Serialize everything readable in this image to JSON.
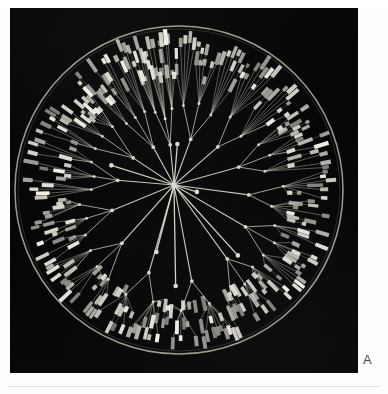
{
  "figure": {
    "panel_label": "A",
    "caption_present": false,
    "background_color": "#ffffff",
    "panel_color": "#050505",
    "stroke_color": "#e8e4d8",
    "leaf_color": "#f2efe6",
    "node_color": "#ddd9cc",
    "ring_color": "#b9b4a5"
  },
  "chart_data": {
    "type": "radial-dendrogram",
    "title": "",
    "subtitle": "",
    "xlabel": "",
    "ylabel": "",
    "legend": [],
    "annotations": [
      "A"
    ],
    "layout": {
      "center_x": 169,
      "center_y": 182,
      "outer_ring_radius": 164,
      "leaf_band_inner_radius": 96,
      "leaf_band_outer_radius": 158,
      "grid": false,
      "legend_position": "none"
    },
    "root": {
      "x": 164,
      "y": 177,
      "label": "root"
    },
    "hubs": [
      {
        "angle_deg": 268,
        "radius": 46,
        "label": "hub-upper"
      },
      {
        "angle_deg": 6,
        "radius": 18,
        "label": "hub-right"
      },
      {
        "angle_deg": 110,
        "radius": 66,
        "label": "hub-lower-left"
      },
      {
        "angle_deg": 92,
        "radius": 96,
        "label": "hub-lower"
      },
      {
        "angle_deg": 48,
        "radius": 88,
        "label": "hub-lower-right"
      },
      {
        "angle_deg": 200,
        "radius": 72,
        "label": "hub-left"
      }
    ],
    "branch_count": 14,
    "leaf_count": 232,
    "clades": [
      {
        "name": "clade-01",
        "start_angle_deg": -92,
        "end_angle_deg": -62,
        "leaves": 17,
        "hub_radius": 52
      },
      {
        "name": "clade-02",
        "start_angle_deg": -62,
        "end_angle_deg": -34,
        "leaves": 16,
        "hub_radius": 58
      },
      {
        "name": "clade-03",
        "start_angle_deg": -34,
        "end_angle_deg": -8,
        "leaves": 15,
        "hub_radius": 64
      },
      {
        "name": "clade-04",
        "start_angle_deg": -8,
        "end_angle_deg": 16,
        "leaves": 14,
        "hub_radius": 70
      },
      {
        "name": "clade-05",
        "start_angle_deg": 16,
        "end_angle_deg": 42,
        "leaves": 16,
        "hub_radius": 76
      },
      {
        "name": "clade-06",
        "start_angle_deg": 42,
        "end_angle_deg": 68,
        "leaves": 18,
        "hub_radius": 84
      },
      {
        "name": "clade-07",
        "start_angle_deg": 68,
        "end_angle_deg": 96,
        "leaves": 19,
        "hub_radius": 92
      },
      {
        "name": "clade-08",
        "start_angle_deg": 96,
        "end_angle_deg": 124,
        "leaves": 18,
        "hub_radius": 88
      },
      {
        "name": "clade-09",
        "start_angle_deg": 124,
        "end_angle_deg": 150,
        "leaves": 17,
        "hub_radius": 78
      },
      {
        "name": "clade-10",
        "start_angle_deg": 150,
        "end_angle_deg": 176,
        "leaves": 16,
        "hub_radius": 70
      },
      {
        "name": "clade-11",
        "start_angle_deg": 176,
        "end_angle_deg": 202,
        "leaves": 15,
        "hub_radius": 62
      },
      {
        "name": "clade-12",
        "start_angle_deg": 202,
        "end_angle_deg": 228,
        "leaves": 16,
        "hub_radius": 56
      },
      {
        "name": "clade-13",
        "start_angle_deg": 228,
        "end_angle_deg": 250,
        "leaves": 14,
        "hub_radius": 50
      },
      {
        "name": "clade-14",
        "start_angle_deg": 250,
        "end_angle_deg": 268,
        "leaves": 21,
        "hub_radius": 46
      }
    ],
    "leaf_tip_style": {
      "shape": "rounded-rectangle",
      "length_range_px": [
        5,
        16
      ],
      "thickness_px": 3.6,
      "brightness_range": [
        0.45,
        1.0
      ]
    }
  }
}
